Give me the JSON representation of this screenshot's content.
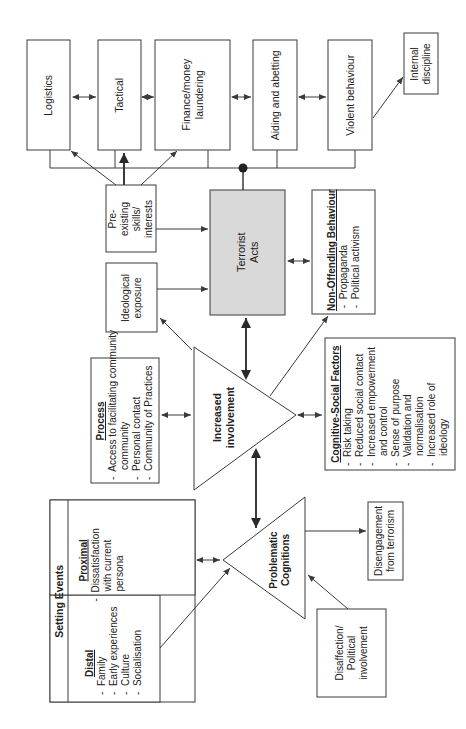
{
  "diagram": {
    "orientation": "rotated 90 degrees counter-clockwise",
    "colors": {
      "line": "#3a3a3a",
      "box_fill": "#ffffff",
      "terrorist_acts_fill": "#d9d9d9"
    },
    "activity_boxes": [
      {
        "id": "logistics",
        "label": "Logistics"
      },
      {
        "id": "tactical",
        "label": "Tactical"
      },
      {
        "id": "finance",
        "label": "Finance/money laundering"
      },
      {
        "id": "aiding",
        "label": "Aiding and abetting"
      },
      {
        "id": "violent",
        "label": "Violent behaviour"
      }
    ],
    "internal_discipline": {
      "label": "Internal discipline"
    },
    "pre_existing": {
      "label": "Pre-existing skills/ interests"
    },
    "terrorist_acts": {
      "label": "Terrorist Acts"
    },
    "ideological_exposure": {
      "label": "Ideological exposure"
    },
    "non_offending": {
      "title": "Non-Offending Behaviour",
      "items": [
        "Propaganda",
        "Political activism"
      ]
    },
    "process": {
      "title": "Process",
      "items": [
        "Access to facilitating community",
        "Personal contact",
        "Community of Practices"
      ]
    },
    "increased_involvement": {
      "label": "Increased involvement"
    },
    "cognitive_social": {
      "title": "Cognitive-Social Factors",
      "items": [
        "Risk taking",
        "Reduced social contact",
        "Increased empowerment and control",
        "Sense of purpose",
        "Validation and normalisation",
        "Increased role of ideology"
      ]
    },
    "setting_events": {
      "title": "Setting Events",
      "distal": {
        "title": "Distal",
        "items": [
          "Family",
          "Early experiences",
          "Culture",
          "Socialisation"
        ]
      },
      "proximal": {
        "title": "Proximal",
        "items": [
          "Dissatisfaction with current persona"
        ]
      }
    },
    "problematic_cognitions": {
      "label": "Problematic Cognitions"
    },
    "disengagement": {
      "label": "Disengagement from terrorism"
    },
    "disaffection": {
      "label": "Disaffection/ Political involvement"
    },
    "bullet": "-"
  }
}
